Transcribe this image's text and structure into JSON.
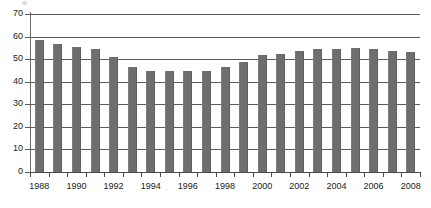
{
  "chart_data": {
    "type": "bar",
    "title": "",
    "subtitle": "",
    "xlabel": "",
    "ylabel": "",
    "ylim": [
      0,
      70
    ],
    "ytick_step": 10,
    "yticks": [
      0,
      10,
      20,
      30,
      40,
      50,
      60,
      70
    ],
    "grid": true,
    "legend": null,
    "legend_position": "none",
    "bar_color": "#6e6e6e",
    "categories": [
      "1988",
      "1989",
      "1990",
      "1991",
      "1992",
      "1993",
      "1994",
      "1995",
      "1996",
      "1997",
      "1998",
      "1999",
      "2000",
      "2001",
      "2002",
      "2003",
      "2004",
      "2005",
      "2006",
      "2007",
      "2008"
    ],
    "xtick_labels": [
      "1988",
      "1990",
      "1992",
      "1994",
      "1996",
      "1998",
      "2000",
      "2002",
      "2004",
      "2006",
      "2008"
    ],
    "values": [
      58.5,
      56.8,
      55.5,
      54.6,
      51.0,
      46.7,
      44.7,
      44.8,
      44.8,
      44.7,
      46.6,
      48.8,
      51.7,
      52.2,
      53.8,
      54.6,
      54.5,
      54.8,
      54.4,
      53.7,
      53.3
    ]
  }
}
